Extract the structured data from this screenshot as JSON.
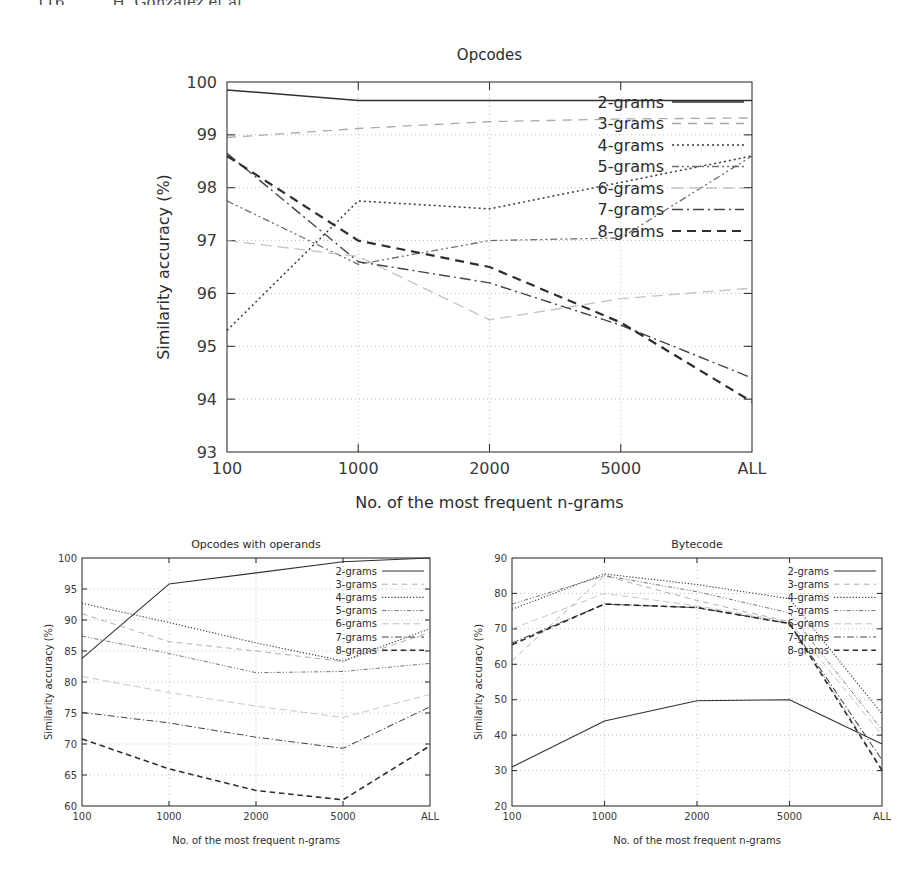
{
  "page_header": {
    "folio": "116",
    "running_head": "H. González et al."
  },
  "axis_titles": {
    "x": "No. of the most frequent n-grams",
    "y": "Similarity accuracy (%)"
  },
  "series_names": [
    "2-grams",
    "3-grams",
    "4-grams",
    "5-grams",
    "6-grams",
    "7-grams",
    "8-grams"
  ],
  "series_styles": [
    {
      "name": "2-grams",
      "style": "solid",
      "dash": "none",
      "color": "#303030",
      "width": 1.5
    },
    {
      "name": "3-grams",
      "style": "dashed-light",
      "dash": "9,7",
      "color": "#a9a9a9",
      "width": 1.3
    },
    {
      "name": "4-grams",
      "style": "dotted",
      "dash": "2,3",
      "color": "#3a3a3a",
      "width": 1.5
    },
    {
      "name": "5-grams",
      "style": "dash-dot-dot",
      "dash": "7,3,2,3,2,3",
      "color": "#6e6e6e",
      "width": 1.3
    },
    {
      "name": "6-grams",
      "style": "dashed-faint",
      "dash": "11,6",
      "color": "#c2c2c2",
      "width": 1.3
    },
    {
      "name": "7-grams",
      "style": "dash-dot",
      "dash": "11,4,2,4",
      "color": "#454545",
      "width": 1.4
    },
    {
      "name": "8-grams",
      "style": "dashed-bold",
      "dash": "9,6",
      "color": "#2e2e2e",
      "width": 2.2
    }
  ],
  "chart_data": [
    {
      "id": "opcodes",
      "type": "line",
      "title": "Opcodes",
      "xlabel": "No. of the most frequent n-grams",
      "ylabel": "Similarity accuracy (%)",
      "categories": [
        "100",
        "1000",
        "2000",
        "5000",
        "ALL"
      ],
      "yticks": [
        93,
        94,
        95,
        96,
        97,
        98,
        99,
        100
      ],
      "ylim": [
        93,
        100
      ],
      "grid": true,
      "legend_position": "top-right",
      "series": [
        {
          "name": "2-grams",
          "values": [
            99.85,
            99.65,
            99.65,
            99.65,
            99.65
          ]
        },
        {
          "name": "3-grams",
          "values": [
            98.95,
            99.12,
            99.25,
            99.3,
            99.32
          ]
        },
        {
          "name": "4-grams",
          "values": [
            95.3,
            97.75,
            97.6,
            98.1,
            98.6
          ]
        },
        {
          "name": "5-grams",
          "values": [
            97.75,
            96.55,
            97.0,
            97.05,
            98.6
          ]
        },
        {
          "name": "6-grams",
          "values": [
            97.0,
            96.7,
            95.5,
            95.9,
            96.1
          ]
        },
        {
          "name": "7-grams",
          "values": [
            98.65,
            96.6,
            96.2,
            95.4,
            94.4
          ]
        },
        {
          "name": "8-grams",
          "values": [
            98.6,
            97.0,
            96.5,
            95.45,
            93.95
          ]
        }
      ]
    },
    {
      "id": "opcodes-with-operands",
      "type": "line",
      "title": "Opcodes with operands",
      "xlabel": "No. of the most frequent n-grams",
      "ylabel": "Similarity accuracy (%)",
      "categories": [
        "100",
        "1000",
        "2000",
        "5000",
        "ALL"
      ],
      "yticks": [
        60,
        65,
        70,
        75,
        80,
        85,
        90,
        95,
        100
      ],
      "ylim": [
        60,
        100
      ],
      "grid": true,
      "legend_position": "top-right",
      "series": [
        {
          "name": "2-grams",
          "values": [
            83.8,
            95.8,
            97.6,
            99.4,
            100.0
          ]
        },
        {
          "name": "3-grams",
          "values": [
            91.0,
            86.5,
            85.0,
            83.3,
            88.0
          ]
        },
        {
          "name": "4-grams",
          "values": [
            92.7,
            89.6,
            86.3,
            83.4,
            88.6
          ]
        },
        {
          "name": "5-grams",
          "values": [
            87.4,
            84.6,
            81.5,
            81.7,
            83.0
          ]
        },
        {
          "name": "6-grams",
          "values": [
            80.9,
            78.3,
            76.1,
            74.3,
            78.0
          ]
        },
        {
          "name": "7-grams",
          "values": [
            75.1,
            73.4,
            71.1,
            69.3,
            76.0
          ]
        },
        {
          "name": "8-grams",
          "values": [
            70.8,
            66.0,
            62.5,
            61.0,
            69.7
          ]
        }
      ]
    },
    {
      "id": "bytecode",
      "type": "line",
      "title": "Bytecode",
      "xlabel": "No. of the most frequent n-grams",
      "ylabel": "Similarity accuracy (%)",
      "categories": [
        "100",
        "1000",
        "2000",
        "5000",
        "ALL"
      ],
      "yticks": [
        20,
        30,
        40,
        50,
        60,
        70,
        80,
        90
      ],
      "ylim": [
        20,
        90
      ],
      "grid": true,
      "legend_position": "top-right",
      "series": [
        {
          "name": "2-grams",
          "values": [
            31.0,
            44.0,
            49.7,
            50.0,
            37.5
          ]
        },
        {
          "name": "3-grams",
          "values": [
            61.0,
            85.0,
            78.0,
            72.0,
            30.5
          ]
        },
        {
          "name": "4-grams",
          "values": [
            75.5,
            85.5,
            82.5,
            78.5,
            46.0
          ]
        },
        {
          "name": "5-grams",
          "values": [
            77.0,
            85.0,
            80.5,
            74.5,
            41.5
          ]
        },
        {
          "name": "6-grams",
          "values": [
            70.0,
            80.0,
            76.5,
            72.0,
            40.0
          ]
        },
        {
          "name": "7-grams",
          "values": [
            66.0,
            77.0,
            76.0,
            71.5,
            33.0
          ]
        },
        {
          "name": "8-grams",
          "values": [
            65.5,
            77.0,
            76.0,
            71.5,
            30.0
          ]
        }
      ]
    }
  ]
}
